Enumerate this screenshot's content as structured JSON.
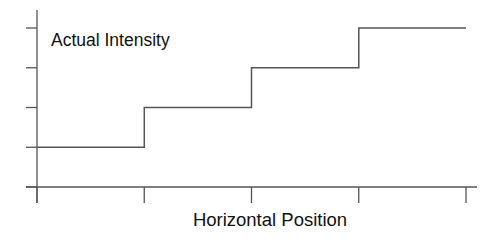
{
  "chart_data": {
    "type": "line",
    "subtype": "step",
    "title": "",
    "xlabel": "Horizontal Position",
    "ylabel": "",
    "annotation": "Actual Intensity",
    "x_ticks": [
      0,
      1,
      2,
      3,
      4
    ],
    "y_ticks": [
      0,
      1,
      2,
      3,
      4
    ],
    "tick_labels_shown": false,
    "xlim": [
      0,
      4
    ],
    "ylim": [
      0,
      4
    ],
    "grid": false,
    "legend": null,
    "series": [
      {
        "name": "Actual Intensity",
        "x": [
          0,
          1,
          1,
          2,
          2,
          3,
          3,
          4
        ],
        "y": [
          1,
          1,
          2,
          2,
          3,
          3,
          4,
          4
        ]
      }
    ],
    "colors": {
      "line": "#555555",
      "text": "#111111",
      "background": "#ffffff"
    }
  }
}
